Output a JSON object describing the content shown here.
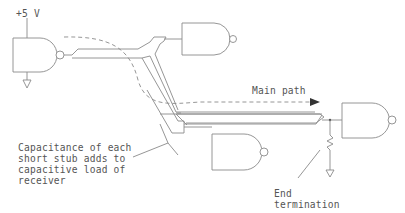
{
  "diagram": {
    "labels": {
      "supply": "+5 V",
      "main_path": "Main path",
      "stub_note": [
        "Capacitance of each",
        "short stub adds to",
        "capacitive load of",
        "receiver"
      ],
      "termination": [
        "End",
        "termination"
      ]
    },
    "components": [
      {
        "id": "driver",
        "type": "NAND gate",
        "role": "driver"
      },
      {
        "id": "receiver-top",
        "type": "NAND gate",
        "role": "stub receiver"
      },
      {
        "id": "receiver-bottom",
        "type": "NAND gate",
        "role": "stub receiver"
      },
      {
        "id": "receiver-end",
        "type": "NAND gate",
        "role": "end receiver"
      },
      {
        "id": "termination-resistor",
        "type": "resistor",
        "role": "end termination"
      }
    ],
    "colors": {
      "line": "#8a8a8a",
      "text": "#555555",
      "background": "#ffffff"
    }
  }
}
